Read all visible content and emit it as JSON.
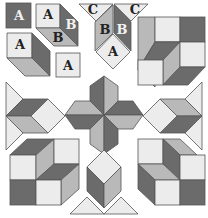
{
  "diagram": {
    "colors": {
      "dark": "#6b6b6b",
      "mid": "#b9b9b9",
      "light": "#ececec",
      "edge": "#555555",
      "background": "#ffffff"
    },
    "piece_labels": {
      "top_left_square": "A",
      "cube_top": "A",
      "cube_right": "B",
      "cube_bottom": "B",
      "cube2_face": "A",
      "small_square": "A",
      "top_c_left": "C",
      "top_c_right": "C",
      "top_b_left": "B",
      "top_b_right": "B",
      "top_diamond": "A"
    }
  }
}
